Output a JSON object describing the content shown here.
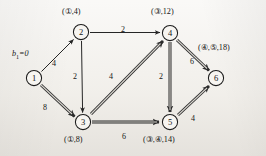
{
  "diagram": {
    "source_label": {
      "text": "b₁=0",
      "base": "b",
      "subscript": "1",
      "value": "=0"
    },
    "nodes": [
      {
        "id": "1",
        "number": "1",
        "cx": 34,
        "cy": 78,
        "label": "",
        "label_x": 0,
        "label_y": 0
      },
      {
        "id": "2",
        "number": "2",
        "cx": 81,
        "cy": 32,
        "label": "(①,4)",
        "label_x": 62,
        "label_y": 8
      },
      {
        "id": "3",
        "number": "3",
        "cx": 83,
        "cy": 122,
        "label": "(①,8)",
        "label_x": 64,
        "label_y": 136
      },
      {
        "id": "4",
        "number": "4",
        "cx": 170,
        "cy": 33,
        "label": "(③,12)",
        "label_x": 151,
        "label_y": 8
      },
      {
        "id": "5",
        "number": "5",
        "cx": 170,
        "cy": 122,
        "label": "(③,④,14)",
        "label_x": 143,
        "label_y": 136
      },
      {
        "id": "6",
        "number": "6",
        "cx": 216,
        "cy": 78,
        "label": "(④,⑤,18)",
        "label_x": 198,
        "label_y": 44
      }
    ],
    "edges": [
      {
        "from": "1",
        "to": "2",
        "weight": "4",
        "style": "thin",
        "weight_x": 52,
        "weight_y": 60
      },
      {
        "from": "1",
        "to": "3",
        "weight": "8",
        "style": "bold",
        "weight_x": 43,
        "weight_y": 104
      },
      {
        "from": "2",
        "to": "4",
        "weight": "2",
        "style": "thin",
        "weight_x": 121,
        "weight_y": 26
      },
      {
        "from": "2",
        "to": "3",
        "weight": "2",
        "style": "thin",
        "weight_x": 73,
        "weight_y": 73
      },
      {
        "from": "3",
        "to": "4",
        "weight": "4",
        "style": "bold",
        "weight_x": 109,
        "weight_y": 73
      },
      {
        "from": "3",
        "to": "5",
        "weight": "6",
        "style": "bold",
        "weight_x": 122,
        "weight_y": 133
      },
      {
        "from": "4",
        "to": "5",
        "weight": "2",
        "style": "bold",
        "weight_x": 159,
        "weight_y": 73
      },
      {
        "from": "4",
        "to": "6",
        "weight": "6",
        "style": "bold",
        "weight_x": 190,
        "weight_y": 58
      },
      {
        "from": "5",
        "to": "6",
        "weight": "4",
        "style": "bold",
        "weight_x": 191,
        "weight_y": 115
      }
    ],
    "colors": {
      "background": "#f4f2ee",
      "ink": "#1b1b1b",
      "node_fill": "#f7f5f1"
    }
  }
}
